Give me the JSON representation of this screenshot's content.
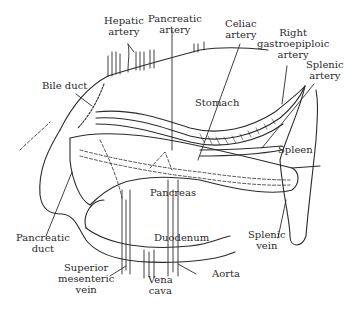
{
  "figure": {
    "labels": [
      {
        "id": "hepatic-artery",
        "lines": [
          "Hepatic",
          "artery"
        ]
      },
      {
        "id": "pancreatic-artery",
        "lines": [
          "Pancreatic",
          "artery"
        ]
      },
      {
        "id": "celiac-artery",
        "lines": [
          "Celiac",
          "artery"
        ]
      },
      {
        "id": "right-gastroepiploic-artery",
        "lines": [
          "Right",
          "gastroepiploic",
          "artery"
        ]
      },
      {
        "id": "splenic-artery",
        "lines": [
          "Splenic",
          "artery"
        ]
      },
      {
        "id": "bile-duct",
        "lines": [
          "Bile duct"
        ]
      },
      {
        "id": "stomach",
        "lines": [
          "Stomach"
        ]
      },
      {
        "id": "spleen",
        "lines": [
          "Spleen"
        ]
      },
      {
        "id": "pancreas",
        "lines": [
          "Pancreas"
        ]
      },
      {
        "id": "pancreatic-duct",
        "lines": [
          "Pancreatic",
          "duct"
        ]
      },
      {
        "id": "duodenum",
        "lines": [
          "Duodenum"
        ]
      },
      {
        "id": "splenic-vein",
        "lines": [
          "Splenic",
          "vein"
        ]
      },
      {
        "id": "superior-mesenteric-vein",
        "lines": [
          "Superior",
          "mesenteric",
          "vein"
        ]
      },
      {
        "id": "vena-cava",
        "lines": [
          "Vena",
          "cava"
        ]
      },
      {
        "id": "aorta",
        "lines": [
          "Aorta"
        ]
      }
    ]
  },
  "colors": {
    "ink": "#2a2a2a",
    "background": "#ffffff"
  }
}
